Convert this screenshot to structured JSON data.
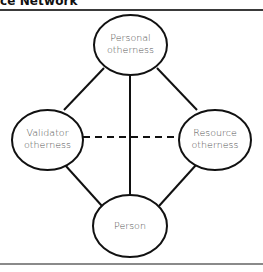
{
  "figure": {
    "title_fragment": "ce Network"
  },
  "nodes": [
    {
      "id": "personal",
      "line1": "Personal",
      "line2": "otherness"
    },
    {
      "id": "validator",
      "line1": "Validator",
      "line2": "otherness"
    },
    {
      "id": "resource",
      "line1": "Resource",
      "line2": "otherness"
    },
    {
      "id": "person",
      "line1": "Person",
      "line2": ""
    }
  ],
  "edges": [
    {
      "from": "personal",
      "to": "validator",
      "style": "solid"
    },
    {
      "from": "personal",
      "to": "resource",
      "style": "solid"
    },
    {
      "from": "personal",
      "to": "person",
      "style": "solid"
    },
    {
      "from": "validator",
      "to": "person",
      "style": "solid"
    },
    {
      "from": "resource",
      "to": "person",
      "style": "solid"
    },
    {
      "from": "validator",
      "to": "resource",
      "style": "dashed"
    }
  ],
  "colors": {
    "stroke": "#111111",
    "label": "#555555",
    "top_rule": "#3a3a3a",
    "bottom_rule": "#8a8a8a"
  }
}
